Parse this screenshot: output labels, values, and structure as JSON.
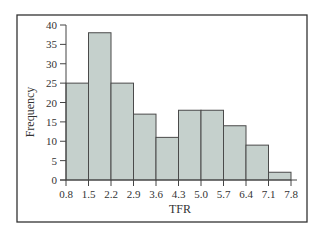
{
  "chart_data": {
    "type": "bar",
    "subtype": "histogram",
    "title": "",
    "xlabel": "TFR",
    "ylabel": "Frequency",
    "bin_edges": [
      0.8,
      1.5,
      2.2,
      2.9,
      3.6,
      4.3,
      5.0,
      5.7,
      6.4,
      7.1,
      7.8
    ],
    "categories": [
      "0.8-1.5",
      "1.5-2.2",
      "2.2-2.9",
      "2.9-3.6",
      "3.6-4.3",
      "4.3-5.0",
      "5.0-5.7",
      "5.7-6.4",
      "6.4-7.1",
      "7.1-7.8"
    ],
    "values": [
      25,
      38,
      25,
      17,
      11,
      18,
      18,
      14,
      9,
      2
    ],
    "x_tick_labels": [
      "0.8",
      "1.5",
      "2.2",
      "2.9",
      "3.6",
      "4.3",
      "5.0",
      "5.7",
      "6.4",
      "7.1",
      "7.8"
    ],
    "y_ticks": [
      0,
      5,
      10,
      15,
      20,
      25,
      30,
      35,
      40
    ],
    "ylim": [
      0,
      40
    ],
    "xlim": [
      0.8,
      7.8
    ],
    "grid": false,
    "legend": null,
    "colors": {
      "bar_fill": "#c5d0cc",
      "bar_edge": "#4a4a4a",
      "frame": "#333333"
    }
  }
}
